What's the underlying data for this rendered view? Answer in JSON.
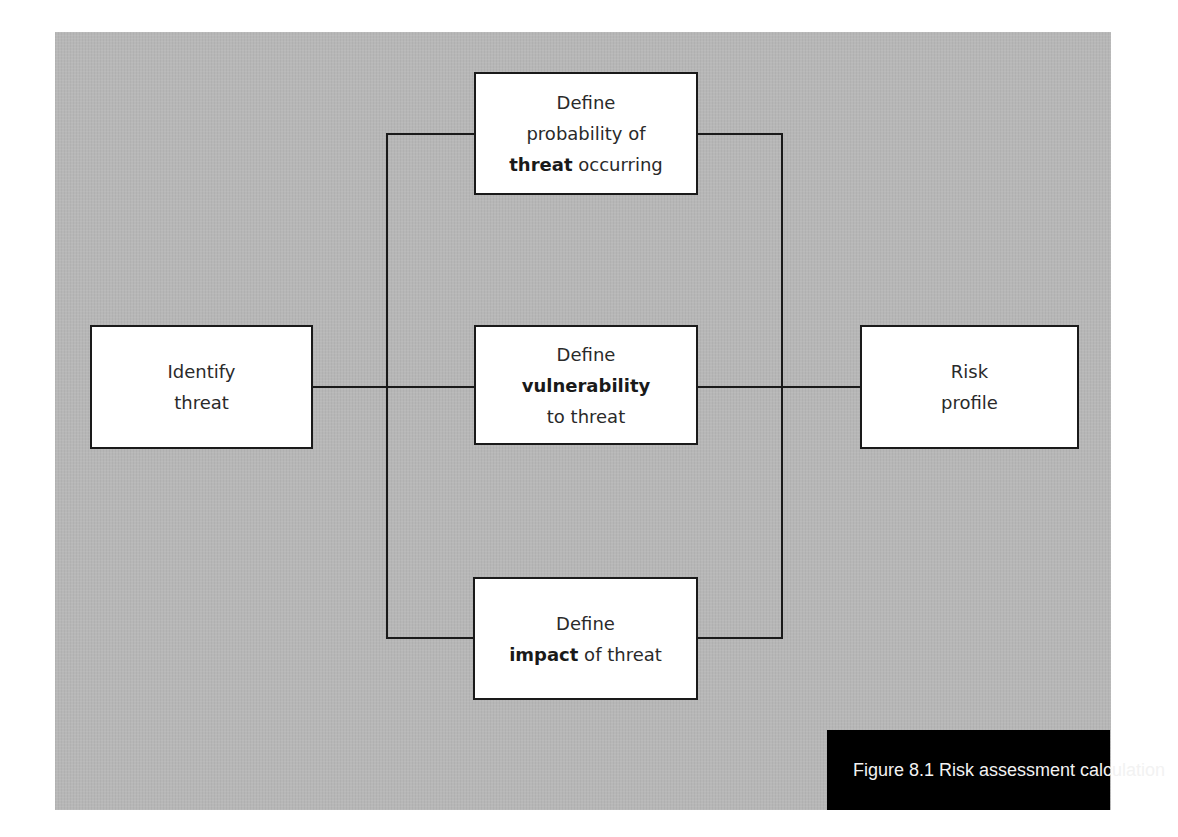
{
  "figure": {
    "caption": "Figure 8.1 Risk assessment calculation",
    "background_color": "#b7b7b7",
    "caption_bg_color": "#000000",
    "caption_text_color": "#f2f2f2",
    "box_fill": "#ffffff",
    "line_color": "#1a1a1a"
  },
  "nodes": {
    "identify": {
      "line1": "Identify",
      "line2": "threat"
    },
    "probability": {
      "line1": "Define",
      "line2": "probability of",
      "line3_bold": "threat",
      "line3_rest": " occurring"
    },
    "vulnerability": {
      "line1": "Define",
      "line2_bold": "vulnerability",
      "line3": "to threat"
    },
    "impact": {
      "line1": "Define",
      "line2_bold": "impact",
      "line2_rest": " of threat"
    },
    "risk": {
      "line1": "Risk",
      "line2": "profile"
    }
  },
  "edges": [
    {
      "from": "Identify threat",
      "to": "Define probability of threat occurring"
    },
    {
      "from": "Identify threat",
      "to": "Define vulnerability to threat"
    },
    {
      "from": "Identify threat",
      "to": "Define impact of threat"
    },
    {
      "from": "Define probability of threat occurring",
      "to": "Risk profile"
    },
    {
      "from": "Define vulnerability to threat",
      "to": "Risk profile"
    },
    {
      "from": "Define impact of threat",
      "to": "Risk profile"
    }
  ]
}
